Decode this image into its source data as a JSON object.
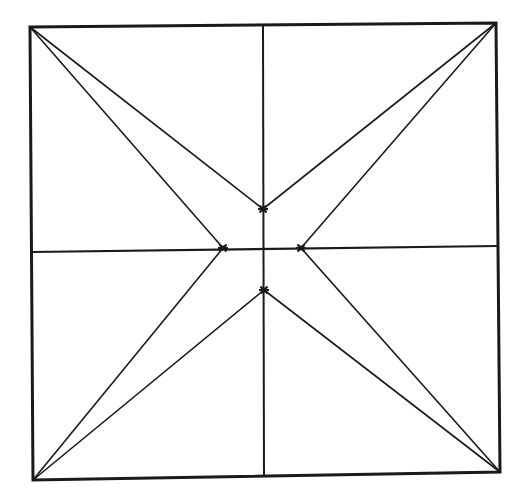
{
  "diagram": {
    "type": "geometric-construction",
    "stroke_color": "#1a1a1a",
    "background_color": "#ffffff",
    "square": {
      "corners": {
        "top_left": [
          30,
          27
        ],
        "top_right": [
          496,
          23
        ],
        "bottom_right": [
          500,
          472
        ],
        "bottom_left": [
          33,
          480
        ]
      }
    },
    "midlines": {
      "vertical": {
        "from": [
          263,
          25
        ],
        "to": [
          264,
          476
        ]
      },
      "horizontal": {
        "from": [
          32,
          252
        ],
        "to": [
          498,
          246
        ]
      }
    },
    "inner_points": {
      "top": [
        263,
        209
      ],
      "left": [
        223,
        248
      ],
      "right": [
        301,
        248
      ],
      "bottom": [
        264,
        290
      ]
    },
    "corner_rays": [
      {
        "from": "top_left",
        "to": "top"
      },
      {
        "from": "top_left",
        "to": "left"
      },
      {
        "from": "top_right",
        "to": "top"
      },
      {
        "from": "top_right",
        "to": "right"
      },
      {
        "from": "bottom_left",
        "to": "left"
      },
      {
        "from": "bottom_left",
        "to": "bottom"
      },
      {
        "from": "bottom_right",
        "to": "right"
      },
      {
        "from": "bottom_right",
        "to": "bottom"
      }
    ],
    "labels": []
  }
}
